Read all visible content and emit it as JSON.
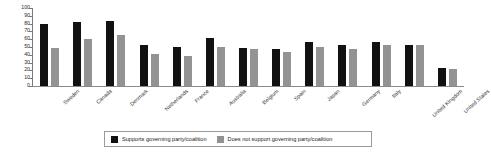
{
  "chart_data": {
    "type": "bar",
    "title": "",
    "xlabel": "",
    "ylabel": "",
    "ylim": [
      0,
      100
    ],
    "yticks": [
      0,
      10,
      20,
      30,
      40,
      50,
      60,
      70,
      80,
      90,
      100
    ],
    "grid": false,
    "legend_position": "bottom",
    "categories": [
      "Sweden",
      "Canada",
      "Denmark",
      "Netherlands",
      "France",
      "Australia",
      "Belgium",
      "Spain",
      "Japan",
      "Germany",
      "Italy",
      "United Kingdom",
      "United States"
    ],
    "series": [
      {
        "name": "Supports governing party/coalition",
        "color": "#111111",
        "values": [
          80,
          82,
          83,
          52,
          50,
          61,
          49,
          48,
          56,
          52,
          57,
          53,
          23
        ]
      },
      {
        "name": "Does not support governing party/coalition",
        "color": "#939393",
        "values": [
          49,
          60,
          65,
          41,
          38,
          50,
          47,
          44,
          50,
          47,
          52,
          53,
          22
        ]
      }
    ]
  },
  "legend": {
    "entries": [
      {
        "label": "Supports governing party/coalition",
        "color": "#111111"
      },
      {
        "label": "Does not support governing party/coalition",
        "color": "#939393"
      }
    ]
  }
}
